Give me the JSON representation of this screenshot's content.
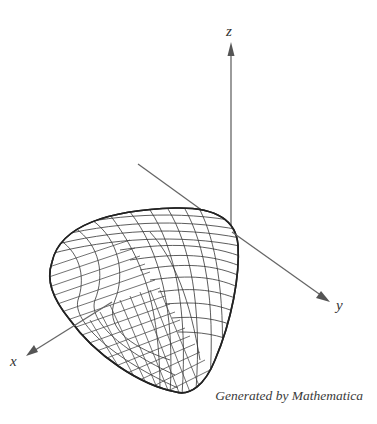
{
  "figure": {
    "type": "3d-wireframe-surface",
    "axes": {
      "x": {
        "label": "x"
      },
      "y": {
        "label": "y"
      },
      "z": {
        "label": "z"
      }
    },
    "caption": "Generated by Mathematica",
    "colors": {
      "background": "#ffffff",
      "axis": "#666666",
      "mesh": "#333333",
      "text": "#333333"
    }
  }
}
